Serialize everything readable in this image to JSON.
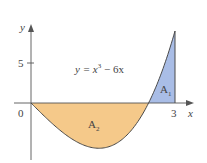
{
  "figure": {
    "equation": "y = x³ − 6x",
    "equation_parts": {
      "lhs": "y = x",
      "exp": "3",
      "rhs": " − 6x"
    },
    "axis_x_label": "x",
    "axis_y_label": "y",
    "origin_label": "0",
    "tick_x_label": "3",
    "tick_y_label": "5",
    "region_above": {
      "label": "A",
      "sub": "1",
      "color": "#a9bde6"
    },
    "region_below": {
      "label": "A",
      "sub": "2",
      "color": "#f5c98a"
    },
    "curve_color": "#4a4a4a",
    "axis_color": "#555555"
  },
  "chart_data": {
    "type": "area",
    "title": "",
    "function": "y = x^3 - 6x",
    "x_range": [
      0,
      3
    ],
    "xlabel": "x",
    "ylabel": "y",
    "x_ticks": [
      3
    ],
    "y_ticks": [
      5
    ],
    "x": [
      0,
      0.5,
      1,
      1.414,
      2,
      2.449,
      3
    ],
    "y": [
      0,
      -2.875,
      -5,
      -5.657,
      -4,
      0,
      9
    ],
    "regions": [
      {
        "name": "A1",
        "x_interval": [
          2.449,
          3
        ],
        "sign": "above x-axis",
        "color": "#a9bde6"
      },
      {
        "name": "A2",
        "x_interval": [
          0,
          2.449
        ],
        "sign": "below x-axis",
        "color": "#f5c98a"
      }
    ],
    "grid": false
  }
}
